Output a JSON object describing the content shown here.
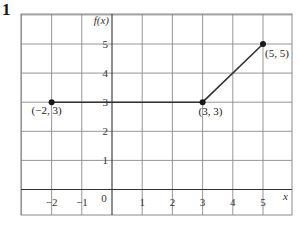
{
  "question": {
    "number": "1"
  },
  "chart_data": {
    "type": "line",
    "title": "",
    "xlabel": "x",
    "ylabel": "f(x)",
    "xlim": [
      -3,
      6
    ],
    "ylim": [
      -1,
      6
    ],
    "grid": true,
    "x_ticks": [
      "−2",
      "−1",
      "0",
      "1",
      "2",
      "3",
      "4",
      "5"
    ],
    "y_ticks": [
      "1",
      "2",
      "3",
      "4",
      "5"
    ],
    "series": [
      {
        "name": "f(x)",
        "points": [
          {
            "x": -2,
            "y": 3,
            "label": "(−2, 3)"
          },
          {
            "x": 3,
            "y": 3,
            "label": "(3, 3)"
          },
          {
            "x": 5,
            "y": 5,
            "label": "(5, 5)"
          }
        ]
      }
    ]
  }
}
